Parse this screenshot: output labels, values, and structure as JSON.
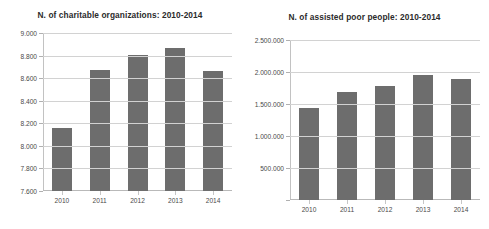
{
  "chart_data": [
    {
      "type": "bar",
      "panel": "left",
      "title": "N. of charitable organizations: 2010-2014",
      "xlabel": "",
      "ylabel": "",
      "categories": [
        "2010",
        "2011",
        "2012",
        "2013",
        "2014"
      ],
      "values": [
        8155,
        8670,
        8805,
        8870,
        8660
      ],
      "ylim": [
        7600,
        9000
      ],
      "yticks": [
        7600,
        7800,
        8000,
        8200,
        8400,
        8600,
        8800,
        9000
      ],
      "ytick_labels": [
        "7.600",
        "7.800",
        "8.000",
        "8.200",
        "8.400",
        "8.600",
        "8.800",
        "9.000"
      ],
      "bar_color": "#6d6d6d",
      "grid": true,
      "legend": "none"
    },
    {
      "type": "bar",
      "panel": "right",
      "title": "N. of assisted poor people: 2010-2014",
      "xlabel": "",
      "ylabel": "",
      "categories": [
        "2010",
        "2011",
        "2012",
        "2013",
        "2014"
      ],
      "values": [
        1440000,
        1690000,
        1780000,
        1950000,
        1890000
      ],
      "ylim": [
        0,
        2500000
      ],
      "yticks": [
        0,
        500000,
        1000000,
        1500000,
        2000000,
        2500000
      ],
      "ytick_labels": [
        "",
        "500.000",
        "1.000.000",
        "1.500.000",
        "2.000.000",
        "2.500.000"
      ],
      "bar_color": "#6d6d6d",
      "grid": true,
      "legend": "none"
    }
  ]
}
